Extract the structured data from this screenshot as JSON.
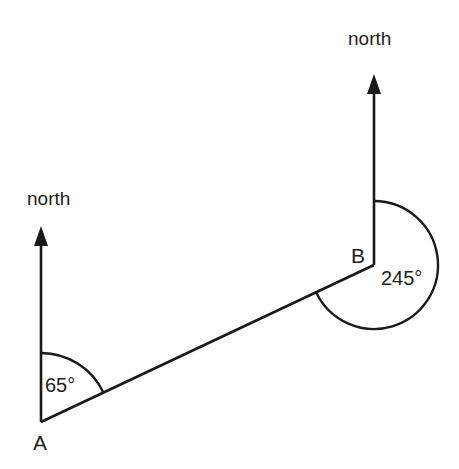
{
  "figure": {
    "background_color": "#ffffff",
    "line_color": "#1a1a1a",
    "text_color": "#231f20",
    "width": 459,
    "height": 469
  },
  "points": {
    "a": {
      "label": "A",
      "x": 41,
      "y": 422,
      "label_x": 33,
      "label_y": 450
    },
    "b": {
      "label": "B",
      "x": 374,
      "y": 265,
      "label_x": 351,
      "label_y": 263
    }
  },
  "north_labels": {
    "at_a": {
      "text": "north",
      "x": 27,
      "y": 205
    },
    "at_b": {
      "text": "north",
      "x": 348,
      "y": 45
    }
  },
  "north_arrows": {
    "at_a": {
      "name": "north-arrow-a",
      "tip_x": 41,
      "tip_y": 226,
      "base_x": 41,
      "base_y": 422,
      "head_length": 20,
      "head_half_width": 7
    },
    "at_b": {
      "name": "north-arrow-b",
      "tip_x": 374,
      "tip_y": 74,
      "base_x": 374,
      "base_y": 265,
      "head_length": 20,
      "head_half_width": 7
    }
  },
  "segment_ab": {
    "name": "line-segment-a-to-b",
    "x1": 41,
    "y1": 422,
    "x2": 374,
    "y2": 265
  },
  "angles": {
    "at_a": {
      "label": "65°",
      "value": 65,
      "unit": "degrees",
      "vertex": "A",
      "radius": 69,
      "start_bearing": 0,
      "end_bearing": 65,
      "label_x": 45,
      "label_y": 392
    },
    "at_b": {
      "label": "245°",
      "value": 245,
      "unit": "degrees",
      "vertex": "B",
      "radius": 64,
      "start_bearing": 0,
      "end_bearing": 245,
      "label_x": 381,
      "label_y": 285
    }
  },
  "chart_data": {
    "type": "diagram",
    "subtype": "bearings",
    "nodes": [
      {
        "id": "A",
        "label": "A",
        "x": 41,
        "y": 422
      },
      {
        "id": "B",
        "label": "B",
        "x": 374,
        "y": 265
      }
    ],
    "edges": [
      {
        "from": "A",
        "to": "B",
        "style": "solid"
      }
    ],
    "annotations": [
      {
        "at": "A",
        "text": "65°",
        "value": 65,
        "type": "angle-arc",
        "reference": "north"
      },
      {
        "at": "B",
        "text": "245°",
        "value": 245,
        "type": "angle-arc",
        "reference": "north"
      },
      {
        "at": "A",
        "text": "north",
        "type": "direction-arrow"
      },
      {
        "at": "B",
        "text": "north",
        "type": "direction-arrow"
      }
    ]
  }
}
